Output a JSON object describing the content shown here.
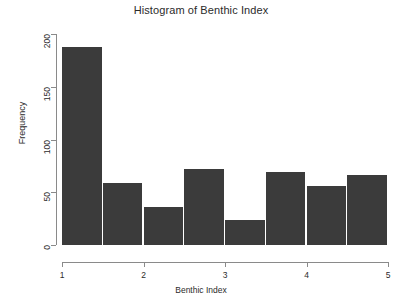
{
  "chart_data": {
    "type": "bar",
    "title": "Histogram of Benthic Index",
    "xlabel": "Benthic Index",
    "ylabel": "Frequency",
    "bin_width": 0.5,
    "bin_edges": [
      1,
      1.5,
      2,
      2.5,
      3,
      3.5,
      4,
      4.5,
      5
    ],
    "categories": [
      "1-1.5",
      "1.5-2",
      "2-2.5",
      "2.5-3",
      "3-3.5",
      "3.5-4",
      "4-4.5",
      "4.5-5"
    ],
    "values": [
      188,
      59,
      36,
      72,
      24,
      69,
      56,
      66
    ],
    "xlim": [
      1,
      5
    ],
    "ylim": [
      0,
      200
    ],
    "x_ticks": [
      "1",
      "2",
      "3",
      "4",
      "5"
    ],
    "x_tick_values": [
      1,
      2,
      3,
      4,
      5
    ],
    "y_ticks": [
      "0",
      "50",
      "100",
      "150",
      "200"
    ],
    "y_tick_values": [
      0,
      50,
      100,
      150,
      200
    ],
    "grid": false,
    "legend": false,
    "bar_color": "#3b3b3b",
    "axis_color": "#8a8a8a",
    "text_color": "#2b2b2b",
    "background": "#ffffff"
  }
}
